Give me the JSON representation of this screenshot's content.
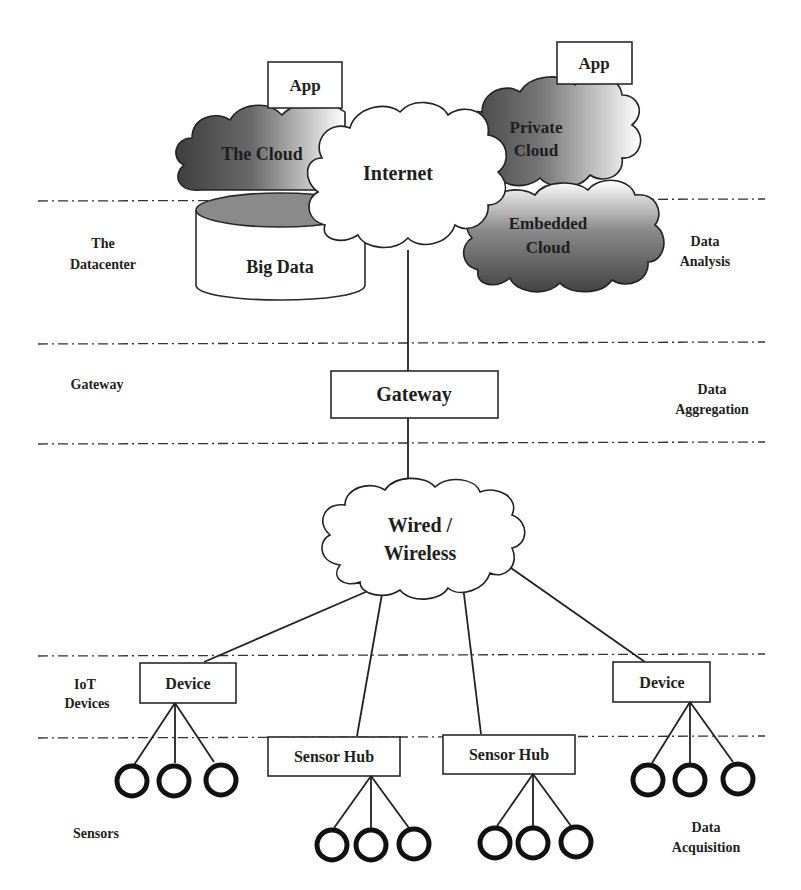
{
  "diagram": {
    "layers_left": {
      "datacenter": [
        "The",
        "Datacenter"
      ],
      "gateway": "Gateway",
      "iot_devices": [
        "IoT",
        "Devices"
      ],
      "sensors": "Sensors"
    },
    "layers_right": {
      "data_analysis": [
        "Data",
        "Analysis"
      ],
      "data_aggregation": [
        "Data",
        "Aggregation"
      ],
      "data_acquisition": [
        "Data",
        "Acquisition"
      ]
    },
    "nodes": {
      "app_left": "App",
      "app_right": "App",
      "the_cloud": "The Cloud",
      "internet": "Internet",
      "private_cloud": [
        "Private",
        "Cloud"
      ],
      "embedded_cloud": [
        "Embedded",
        "Cloud"
      ],
      "big_data": "Big Data",
      "gateway": "Gateway",
      "wired_wireless": [
        "Wired /",
        "Wireless"
      ],
      "device_left": "Device",
      "device_right": "Device",
      "sensor_hub_left": "Sensor Hub",
      "sensor_hub_right": "Sensor Hub"
    },
    "sensor_groups": [
      {
        "parent": "Device (left)",
        "count": 3
      },
      {
        "parent": "Sensor Hub (left)",
        "count": 3
      },
      {
        "parent": "Sensor Hub (right)",
        "count": 3
      },
      {
        "parent": "Device (right)",
        "count": 3
      }
    ],
    "colors": {
      "cloud_dark": "#4a4a4a",
      "cloud_light": "#ffffff",
      "line": "#222222",
      "background": "#ffffff"
    }
  }
}
